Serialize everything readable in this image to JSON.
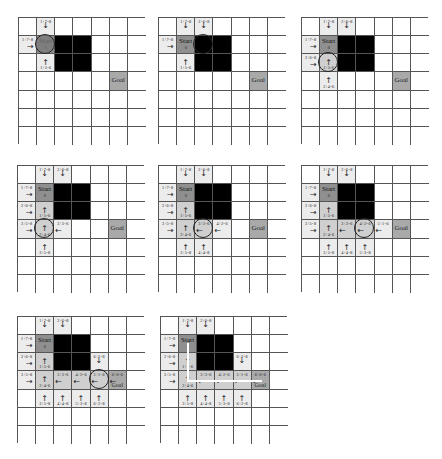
{
  "figure": {
    "grid_size": {
      "cols": 7,
      "rows": 7
    },
    "colors": {
      "open": "#ececec",
      "closed": "#cfcfcf",
      "start": "#8f8f8f",
      "goal": "#a9a9a9",
      "obstacle": "#000000",
      "grid_line": "#555555"
    },
    "obstacles": [
      [
        2,
        1
      ],
      [
        3,
        1
      ],
      [
        2,
        2
      ],
      [
        3,
        2
      ]
    ],
    "start": [
      1,
      1
    ],
    "goal": [
      5,
      3
    ],
    "labels": {
      "start": "Start",
      "goal": "Goal",
      "start_cost": "0"
    },
    "panels": [
      {
        "id": 1,
        "current": [
          1,
          1
        ],
        "cells": [
          {
            "pos": [
              1,
              0
            ],
            "type": "open",
            "label": "1+7=8",
            "arrow": "down"
          },
          {
            "pos": [
              0,
              1
            ],
            "type": "open",
            "label": "1+7=8",
            "arrow": "right"
          },
          {
            "pos": [
              2,
              1
            ],
            "type": "open",
            "label": "2+5=6",
            "arrow": "left"
          },
          {
            "pos": [
              1,
              2
            ],
            "type": "open",
            "label": "1+5=6",
            "arrow": "up"
          }
        ]
      },
      {
        "id": 2,
        "current": [
          2,
          1
        ],
        "cells": [
          {
            "pos": [
              1,
              0
            ],
            "type": "open",
            "label": "1+7=8",
            "arrow": "down"
          },
          {
            "pos": [
              2,
              0
            ],
            "type": "open",
            "label": "2+6=8",
            "arrow": "down"
          },
          {
            "pos": [
              0,
              1
            ],
            "type": "open",
            "label": "1+7=8",
            "arrow": "right"
          },
          {
            "pos": [
              2,
              1
            ],
            "type": "closed",
            "label": "1+5=6",
            "arrow": "left"
          },
          {
            "pos": [
              1,
              2
            ],
            "type": "open",
            "label": "1+5=6",
            "arrow": "up"
          }
        ]
      },
      {
        "id": 3,
        "current": [
          1,
          2
        ],
        "cells": [
          {
            "pos": [
              1,
              0
            ],
            "type": "open",
            "label": "1+7=8",
            "arrow": "down"
          },
          {
            "pos": [
              2,
              0
            ],
            "type": "open",
            "label": "2+6=8",
            "arrow": "down"
          },
          {
            "pos": [
              0,
              1
            ],
            "type": "open",
            "label": "1+7=8",
            "arrow": "right"
          },
          {
            "pos": [
              2,
              1
            ],
            "type": "closed",
            "label": "1+5=6",
            "arrow": "left"
          },
          {
            "pos": [
              0,
              2
            ],
            "type": "open",
            "label": "2+6=8",
            "arrow": "right"
          },
          {
            "pos": [
              1,
              2
            ],
            "type": "closed",
            "label": "1+5=6",
            "arrow": "up"
          },
          {
            "pos": [
              1,
              3
            ],
            "type": "open",
            "label": "2+4=6",
            "arrow": "up"
          }
        ]
      },
      {
        "id": 4,
        "current": [
          1,
          3
        ],
        "cells": [
          {
            "pos": [
              1,
              0
            ],
            "type": "open",
            "label": "1+7=8",
            "arrow": "down"
          },
          {
            "pos": [
              2,
              0
            ],
            "type": "open",
            "label": "2+6=8",
            "arrow": "down"
          },
          {
            "pos": [
              0,
              1
            ],
            "type": "open",
            "label": "1+7=8",
            "arrow": "right"
          },
          {
            "pos": [
              2,
              1
            ],
            "type": "closed",
            "label": "1+5=6",
            "arrow": "left"
          },
          {
            "pos": [
              0,
              2
            ],
            "type": "open",
            "label": "2+6=8",
            "arrow": "right"
          },
          {
            "pos": [
              1,
              2
            ],
            "type": "closed",
            "label": "1+5=6",
            "arrow": "up"
          },
          {
            "pos": [
              0,
              3
            ],
            "type": "open",
            "label": "3+5=8",
            "arrow": "right"
          },
          {
            "pos": [
              1,
              3
            ],
            "type": "closed",
            "label": "2+4=6",
            "arrow": "up"
          },
          {
            "pos": [
              2,
              3
            ],
            "type": "open",
            "label": "3+3=6",
            "arrow": "left"
          },
          {
            "pos": [
              1,
              4
            ],
            "type": "open",
            "label": "3+5=8",
            "arrow": "up"
          }
        ]
      },
      {
        "id": 5,
        "current": [
          2,
          3
        ],
        "cells": [
          {
            "pos": [
              1,
              0
            ],
            "type": "open",
            "label": "1+7=8",
            "arrow": "down"
          },
          {
            "pos": [
              2,
              0
            ],
            "type": "open",
            "label": "2+6=8",
            "arrow": "down"
          },
          {
            "pos": [
              0,
              1
            ],
            "type": "open",
            "label": "1+7=8",
            "arrow": "right"
          },
          {
            "pos": [
              2,
              1
            ],
            "type": "closed",
            "label": "1+5=6",
            "arrow": "left"
          },
          {
            "pos": [
              0,
              2
            ],
            "type": "open",
            "label": "2+6=8",
            "arrow": "right"
          },
          {
            "pos": [
              1,
              2
            ],
            "type": "closed",
            "label": "1+5=6",
            "arrow": "up"
          },
          {
            "pos": [
              0,
              3
            ],
            "type": "open",
            "label": "3+5=8",
            "arrow": "right"
          },
          {
            "pos": [
              1,
              3
            ],
            "type": "closed",
            "label": "2+4=6",
            "arrow": "up"
          },
          {
            "pos": [
              2,
              3
            ],
            "type": "closed",
            "label": "3+3=6",
            "arrow": "left"
          },
          {
            "pos": [
              3,
              3
            ],
            "type": "open",
            "label": "4+2=6",
            "arrow": "left"
          },
          {
            "pos": [
              1,
              4
            ],
            "type": "open",
            "label": "3+5=8",
            "arrow": "up"
          },
          {
            "pos": [
              2,
              4
            ],
            "type": "open",
            "label": "4+4=8",
            "arrow": "up"
          }
        ]
      },
      {
        "id": 6,
        "current": [
          3,
          3
        ],
        "cells": [
          {
            "pos": [
              1,
              0
            ],
            "type": "open",
            "label": "1+7=8",
            "arrow": "down"
          },
          {
            "pos": [
              2,
              0
            ],
            "type": "open",
            "label": "2+6=8",
            "arrow": "down"
          },
          {
            "pos": [
              0,
              1
            ],
            "type": "open",
            "label": "1+7=8",
            "arrow": "right"
          },
          {
            "pos": [
              2,
              1
            ],
            "type": "closed",
            "label": "1+5=6",
            "arrow": "left"
          },
          {
            "pos": [
              0,
              2
            ],
            "type": "open",
            "label": "2+6=8",
            "arrow": "right"
          },
          {
            "pos": [
              1,
              2
            ],
            "type": "closed",
            "label": "1+5=6",
            "arrow": "up"
          },
          {
            "pos": [
              0,
              3
            ],
            "type": "open",
            "label": "3+5=8",
            "arrow": "right"
          },
          {
            "pos": [
              1,
              3
            ],
            "type": "closed",
            "label": "2+4=6",
            "arrow": "up"
          },
          {
            "pos": [
              2,
              3
            ],
            "type": "closed",
            "label": "3+3=6",
            "arrow": "left"
          },
          {
            "pos": [
              3,
              3
            ],
            "type": "closed",
            "label": "4+2=6",
            "arrow": "left"
          },
          {
            "pos": [
              4,
              3
            ],
            "type": "open",
            "label": "5+1=6",
            "arrow": "left"
          },
          {
            "pos": [
              1,
              4
            ],
            "type": "open",
            "label": "3+5=8",
            "arrow": "up"
          },
          {
            "pos": [
              2,
              4
            ],
            "type": "open",
            "label": "4+4=8",
            "arrow": "up"
          },
          {
            "pos": [
              3,
              4
            ],
            "type": "open",
            "label": "5+3=8",
            "arrow": "up"
          }
        ]
      },
      {
        "id": 7,
        "current": [
          4,
          3
        ],
        "cells": [
          {
            "pos": [
              1,
              0
            ],
            "type": "open",
            "label": "1+7=8",
            "arrow": "down"
          },
          {
            "pos": [
              2,
              0
            ],
            "type": "open",
            "label": "2+6=8",
            "arrow": "down"
          },
          {
            "pos": [
              0,
              1
            ],
            "type": "open",
            "label": "1+7=8",
            "arrow": "right"
          },
          {
            "pos": [
              2,
              1
            ],
            "type": "closed",
            "label": "1+5=6",
            "arrow": "left"
          },
          {
            "pos": [
              0,
              2
            ],
            "type": "open",
            "label": "2+6=8",
            "arrow": "right"
          },
          {
            "pos": [
              1,
              2
            ],
            "type": "closed",
            "label": "1+5=6",
            "arrow": "up"
          },
          {
            "pos": [
              4,
              2
            ],
            "type": "open",
            "label": "6+2=8",
            "arrow": "down"
          },
          {
            "pos": [
              0,
              3
            ],
            "type": "open",
            "label": "3+5=8",
            "arrow": "right"
          },
          {
            "pos": [
              1,
              3
            ],
            "type": "closed",
            "label": "2+4=6",
            "arrow": "up"
          },
          {
            "pos": [
              2,
              3
            ],
            "type": "closed",
            "label": "3+3=6",
            "arrow": "left"
          },
          {
            "pos": [
              3,
              3
            ],
            "type": "closed",
            "label": "4+2=6",
            "arrow": "left"
          },
          {
            "pos": [
              4,
              3
            ],
            "type": "closed",
            "label": "5+1=6",
            "arrow": "left"
          },
          {
            "pos": [
              5,
              3
            ],
            "type": "goal",
            "label": "6+0=6",
            "arrow": "left"
          },
          {
            "pos": [
              1,
              4
            ],
            "type": "open",
            "label": "3+5=8",
            "arrow": "up"
          },
          {
            "pos": [
              2,
              4
            ],
            "type": "open",
            "label": "4+4=8",
            "arrow": "up"
          },
          {
            "pos": [
              3,
              4
            ],
            "type": "open",
            "label": "5+3=8",
            "arrow": "up"
          },
          {
            "pos": [
              4,
              4
            ],
            "type": "open",
            "label": "6+2=8",
            "arrow": "up"
          }
        ]
      },
      {
        "id": 8,
        "current": null,
        "final_path": [
          [
            1,
            1
          ],
          [
            1,
            2
          ],
          [
            1,
            3
          ],
          [
            2,
            3
          ],
          [
            3,
            3
          ],
          [
            4,
            3
          ],
          [
            5,
            3
          ]
        ],
        "cells": [
          {
            "pos": [
              1,
              0
            ],
            "type": "open",
            "label": "1+7=8",
            "arrow": "down"
          },
          {
            "pos": [
              2,
              0
            ],
            "type": "open",
            "label": "2+6=8",
            "arrow": "down"
          },
          {
            "pos": [
              0,
              1
            ],
            "type": "open",
            "label": "1+7=8",
            "arrow": "right"
          },
          {
            "pos": [
              2,
              1
            ],
            "type": "closed",
            "label": "1+5=6",
            "arrow": "left"
          },
          {
            "pos": [
              0,
              2
            ],
            "type": "open",
            "label": "2+6=8",
            "arrow": "right"
          },
          {
            "pos": [
              1,
              2
            ],
            "type": "closed",
            "label": "1+5=6",
            "arrow": "up"
          },
          {
            "pos": [
              4,
              2
            ],
            "type": "open",
            "label": "6+2=8",
            "arrow": "down"
          },
          {
            "pos": [
              0,
              3
            ],
            "type": "open",
            "label": "3+5=8",
            "arrow": "right"
          },
          {
            "pos": [
              1,
              3
            ],
            "type": "closed",
            "label": "2+4=6",
            "arrow": "up"
          },
          {
            "pos": [
              2,
              3
            ],
            "type": "closed",
            "label": "3+3=6",
            "arrow": "left"
          },
          {
            "pos": [
              3,
              3
            ],
            "type": "closed",
            "label": "4+2=6",
            "arrow": "left"
          },
          {
            "pos": [
              4,
              3
            ],
            "type": "closed",
            "label": "5+1=6",
            "arrow": "left"
          },
          {
            "pos": [
              5,
              3
            ],
            "type": "goal-reached",
            "label": "6+0=6",
            "arrow": "left"
          },
          {
            "pos": [
              1,
              4
            ],
            "type": "open",
            "label": "3+5=8",
            "arrow": "up"
          },
          {
            "pos": [
              2,
              4
            ],
            "type": "open",
            "label": "4+4=8",
            "arrow": "up"
          },
          {
            "pos": [
              3,
              4
            ],
            "type": "open",
            "label": "5+3=8",
            "arrow": "up"
          },
          {
            "pos": [
              4,
              4
            ],
            "type": "open",
            "label": "6+2=8",
            "arrow": "up"
          }
        ]
      }
    ]
  }
}
